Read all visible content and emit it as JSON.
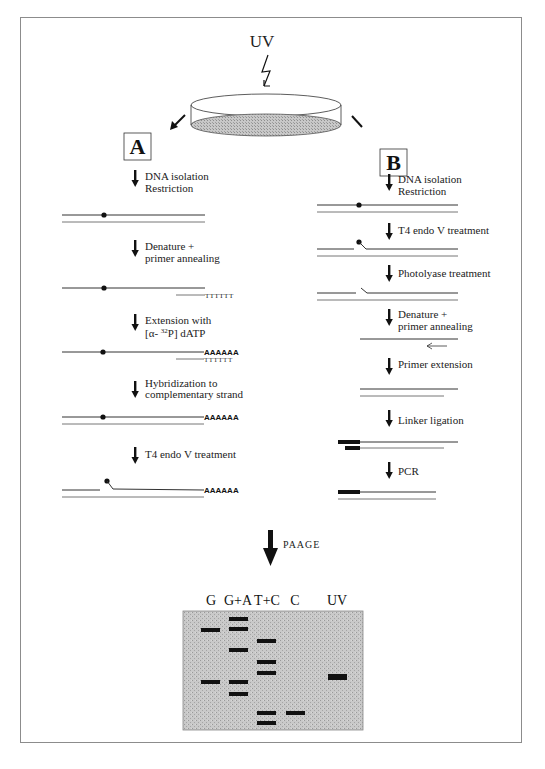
{
  "figure": {
    "uv_label": "UV",
    "panel_a_label": "A",
    "panel_b_label": "B",
    "paage_label": "PAAGE"
  },
  "panel_a": {
    "steps": [
      {
        "line1": "DNA isolation",
        "line2": "Restriction"
      },
      {
        "line1": "Denature +",
        "line2": "primer annealing"
      },
      {
        "line1": "Extension with",
        "line2": "[α- 32P] dATP"
      },
      {
        "line1": "Hybridization to",
        "line2": "complementary strand"
      },
      {
        "line1": "T4 endo V treatment",
        "line2": ""
      }
    ],
    "poly_t": "TTTTTT",
    "poly_a": "AAAAAA"
  },
  "panel_b": {
    "steps": [
      {
        "line1": "DNA isolation",
        "line2": "Restriction"
      },
      {
        "line1": "T4 endo V treatment",
        "line2": ""
      },
      {
        "line1": "Photolyase treatment",
        "line2": ""
      },
      {
        "line1": "Denature +",
        "line2": "primer annealing"
      },
      {
        "line1": "Primer extension",
        "line2": ""
      },
      {
        "line1": "Linker ligation",
        "line2": ""
      },
      {
        "line1": "PCR",
        "line2": ""
      }
    ]
  },
  "gel": {
    "lanes": [
      "G",
      "G+A",
      "T+C",
      "C",
      "UV"
    ],
    "bands": {
      "G": [
        628,
        680
      ],
      "G+A": [
        617,
        627,
        648,
        680,
        692
      ],
      "T+C": [
        639,
        660,
        671,
        711,
        721
      ],
      "C": [
        711
      ],
      "UV": [
        675
      ]
    }
  }
}
